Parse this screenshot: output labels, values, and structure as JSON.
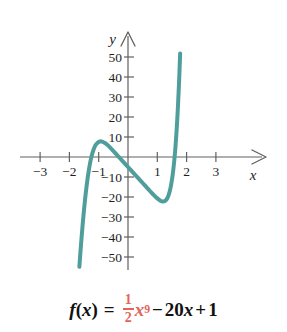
{
  "figure": {
    "title": "",
    "formula": {
      "lhs": "f",
      "lhs_open": "(",
      "lhs_var": "x",
      "lhs_close": ")",
      "equals": "=",
      "coef_numerator": "1",
      "coef_denominator": "2",
      "base_var": "x",
      "exponent": "9",
      "minus": "−",
      "linear_coef": "20",
      "linear_var": "x",
      "plus": "+",
      "constant": "1",
      "plain_text": "f(x) = 1/2 x^9 - 20x + 1"
    },
    "colors": {
      "curve": "#4f9e9c",
      "axis": "#555555",
      "text": "#1f1f1f",
      "accent_red": "#e2645c",
      "background": "#ffffff"
    }
  },
  "chart_data": {
    "type": "line",
    "title": "",
    "xlabel": "x",
    "ylabel": "y",
    "xlim": [
      -3.6,
      3.6
    ],
    "ylim": [
      -60,
      62
    ],
    "grid": false,
    "legend": null,
    "axis_arrows": {
      "x": "right",
      "y": "up"
    },
    "xticks": [
      -3,
      -2,
      -1,
      1,
      2,
      3
    ],
    "xtick_labels": [
      "−3",
      "−2",
      "−1",
      "1",
      "2",
      "3"
    ],
    "yticks": [
      50,
      40,
      30,
      20,
      10,
      -10,
      -20,
      -30,
      -40,
      -50
    ],
    "ytick_labels": [
      "50",
      "40",
      "30",
      "20",
      "10",
      "−10",
      "−20",
      "−30",
      "−40",
      "−50"
    ],
    "series": [
      {
        "name": "f(x) = 1/2 x^9 - 20x + 1",
        "color": "#4f9e9c",
        "linewidth": 4,
        "x": [
          -1.66,
          -1.62,
          -1.58,
          -1.54,
          -1.5,
          -1.46,
          -1.42,
          -1.38,
          -1.34,
          -1.3,
          -1.26,
          -1.22,
          -1.18,
          -1.14,
          -1.1,
          -1.0,
          -0.9,
          -0.8,
          -0.7,
          -0.6,
          -0.5,
          -0.4,
          -0.3,
          -0.2,
          -0.1,
          0.0,
          0.1,
          0.2,
          0.3,
          0.4,
          0.5,
          0.6,
          0.7,
          0.8,
          0.9,
          1.0,
          1.1,
          1.14,
          1.18,
          1.22,
          1.26,
          1.3,
          1.34,
          1.38,
          1.42,
          1.46,
          1.5,
          1.54,
          1.58,
          1.62,
          1.66,
          1.7,
          1.74,
          1.78
        ],
        "y": [
          -54.9,
          -46.9,
          -39.4,
          -32.5,
          -26.2,
          -20.5,
          -15.4,
          -10.8,
          -6.9,
          -3.5,
          -0.7,
          1.6,
          3.5,
          5.0,
          6.1,
          7.5,
          7.8,
          7.1,
          6.0,
          4.6,
          3.0,
          1.4,
          -0.2,
          -1.8,
          -3.4,
          -5.0,
          -6.6,
          -8.2,
          -9.8,
          -11.4,
          -13.0,
          -14.6,
          -16.2,
          -17.8,
          -19.3,
          -20.7,
          -21.8,
          -22.1,
          -22.2,
          -22.2,
          -22.0,
          -21.5,
          -20.6,
          -19.3,
          -17.4,
          -14.8,
          -11.4,
          -7.1,
          -1.7,
          5.1,
          13.5,
          23.8,
          36.4,
          51.8
        ]
      }
    ],
    "annotations": [
      {
        "text": "local maximum",
        "approx_x": -1.24,
        "approx_y": 22
      },
      {
        "text": "local minimum",
        "approx_x": 1.2,
        "approx_y": -21
      }
    ]
  },
  "axes_geometry": {
    "origin_px": [
      128,
      157
    ],
    "x_unit_px": 29.3,
    "y_unit_px": 2.0
  }
}
